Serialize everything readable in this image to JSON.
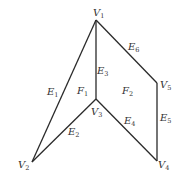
{
  "diagram": {
    "type": "planar-graph",
    "vertices": [
      {
        "id": "V1",
        "base": "V",
        "sub": "1"
      },
      {
        "id": "V2",
        "base": "V",
        "sub": "2"
      },
      {
        "id": "V3",
        "base": "V",
        "sub": "3"
      },
      {
        "id": "V4",
        "base": "V",
        "sub": "4"
      },
      {
        "id": "V5",
        "base": "V",
        "sub": "5"
      }
    ],
    "edges": [
      {
        "id": "E1",
        "base": "E",
        "sub": "1",
        "from": "V1",
        "to": "V2"
      },
      {
        "id": "E2",
        "base": "E",
        "sub": "2",
        "from": "V2",
        "to": "V3"
      },
      {
        "id": "E3",
        "base": "E",
        "sub": "3",
        "from": "V1",
        "to": "V3"
      },
      {
        "id": "E4",
        "base": "E",
        "sub": "4",
        "from": "V3",
        "to": "V4"
      },
      {
        "id": "E5",
        "base": "E",
        "sub": "5",
        "from": "V4",
        "to": "V5"
      },
      {
        "id": "E6",
        "base": "E",
        "sub": "6",
        "from": "V1",
        "to": "V5"
      }
    ],
    "faces": [
      {
        "id": "F1",
        "base": "F",
        "sub": "1"
      },
      {
        "id": "F2",
        "base": "F",
        "sub": "2"
      }
    ]
  }
}
